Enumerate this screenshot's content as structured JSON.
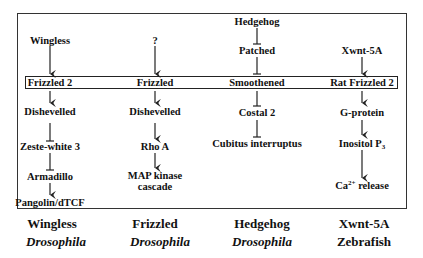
{
  "diagram": {
    "type": "signaling-pathways",
    "columns": [
      {
        "id": "wingless",
        "ligand": "Wingless",
        "receptor": "Frizzled 2",
        "downstream": [
          "Dishevelled",
          "Zeste-white 3",
          "Armadillo",
          "Pangolin/dTCF"
        ],
        "edges": [
          "activates",
          "activates",
          "inhibits",
          "inhibits",
          "activates"
        ],
        "caption_pathway": "Wingless",
        "caption_organism": "Drosophila"
      },
      {
        "id": "frizzled",
        "ligand": "?",
        "receptor": "Frizzled",
        "downstream": [
          "Dishevelled",
          "Rho A",
          "MAP kinase cascade"
        ],
        "downstream_lines": {
          "map_line1": "MAP kinase",
          "map_line2": "cascade"
        },
        "edges": [
          "activates",
          "activates",
          "activates",
          "activates"
        ],
        "caption_pathway": "Frizzled",
        "caption_organism": "Drosophila"
      },
      {
        "id": "hedgehog",
        "ligand": "Hedgehog",
        "intermediate": "Patched",
        "receptor": "Smoothened",
        "downstream": [
          "Costal 2",
          "Cubitus interruptus"
        ],
        "edges": [
          "inhibits",
          "inhibits",
          "inhibits",
          "inhibits"
        ],
        "caption_pathway": "Hedgehog",
        "caption_organism": "Drosophila"
      },
      {
        "id": "xwnt5a",
        "ligand": "Xwnt-5A",
        "receptor": "Rat Frizzled 2",
        "downstream": [
          "G-protein",
          "Inositol P3",
          "Ca2+ release"
        ],
        "downstream_parts": {
          "ip3_base": "Inositol P",
          "ip3_sub": "3",
          "ca_base": "Ca",
          "ca_sup": "2+",
          "ca_rest": " release"
        },
        "edges": [
          "activates",
          "activates",
          "activates",
          "activates"
        ],
        "caption_pathway": "Xwnt-5A",
        "caption_organism": "Zebrafish"
      }
    ],
    "colors": {
      "line": "#222222",
      "background": "#ffffff",
      "text": "#111111"
    }
  }
}
